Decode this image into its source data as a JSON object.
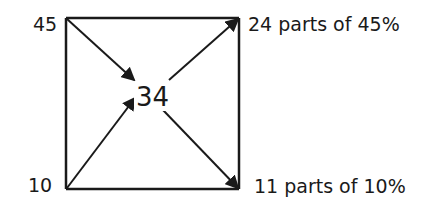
{
  "diagram": {
    "type": "alligation-cross",
    "title": "",
    "corners": {
      "top_left": {
        "label": "45"
      },
      "bottom_left": {
        "label": "10"
      },
      "top_right": {
        "label": "24 parts of 45%"
      },
      "bottom_right": {
        "label": "11 parts of 10%"
      }
    },
    "center": {
      "label": "34"
    },
    "colors": {
      "line": "#1a1a1a",
      "text": "#1a1a1a",
      "background": "#ffffff"
    },
    "edges": [
      {
        "from": "top_left",
        "to": "center",
        "arrow": true
      },
      {
        "from": "bottom_left",
        "to": "center",
        "arrow": true
      },
      {
        "from": "center",
        "to": "top_right",
        "arrow": true
      },
      {
        "from": "center",
        "to": "bottom_right",
        "arrow": true
      }
    ]
  }
}
